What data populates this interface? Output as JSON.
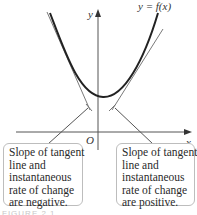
{
  "diagram": {
    "curve_label": "y = f(x)",
    "y_axis_label": "y",
    "x_axis_label": "x",
    "origin_label": "O",
    "curve_color": "#222222",
    "tangent_color": "#777777",
    "axis_color": "#555555"
  },
  "notes": {
    "left": {
      "lines": [
        "Slope of tangent",
        "line and",
        "instantaneous",
        "rate of change",
        "are negative."
      ]
    },
    "right": {
      "lines": [
        "Slope of tangent",
        "line and",
        "instantaneous",
        "rate of change",
        "are positive."
      ]
    }
  },
  "caption": "FIGURE 2.1"
}
